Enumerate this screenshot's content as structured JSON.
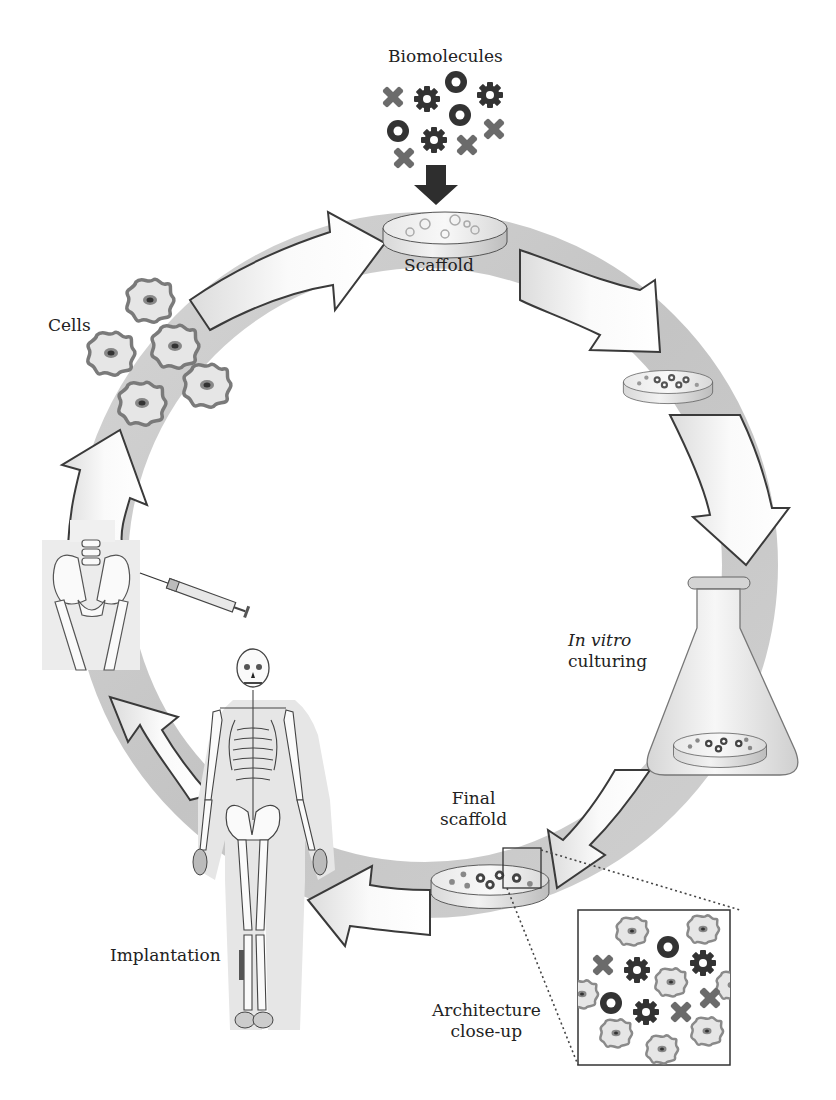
{
  "diagram": {
    "type": "cycle",
    "colors": {
      "ring": "#c8c8c8",
      "arrow_fill": "#f4f4f4",
      "arrow_stroke": "#3a3a3a",
      "gear": "#333333",
      "ring_molecule": "#333333",
      "x_molecule": "#6b6b6b",
      "cell_outline": "#777777",
      "cell_fill": "#e4e4e4",
      "nucleus": "#444444",
      "background": "#ffffff"
    },
    "labels": {
      "biomolecules": "Biomolecules",
      "scaffold": "Scaffold",
      "cells": "Cells",
      "in_vitro_italic": "In vitro",
      "culturing": "culturing",
      "final_line1": "Final",
      "final_line2": "scaffold",
      "implantation": "Implantation",
      "architecture_line1": "Architecture",
      "architecture_line2": "close-up"
    },
    "stages": [
      {
        "id": "biomolecules",
        "label": "Biomolecules",
        "icon": "biomolecule-cluster-icon"
      },
      {
        "id": "scaffold",
        "label": "Scaffold",
        "icon": "scaffold-disc-icon"
      },
      {
        "id": "seeded-scaffold",
        "label": "",
        "icon": "seeded-scaffold-disc-icon"
      },
      {
        "id": "in-vitro-culturing",
        "label": "In vitro culturing",
        "icon": "erlenmeyer-flask-icon"
      },
      {
        "id": "final-scaffold",
        "label": "Final scaffold",
        "icon": "final-scaffold-disc-icon"
      },
      {
        "id": "architecture-close-up",
        "label": "Architecture close-up",
        "icon": "magnified-inset-icon"
      },
      {
        "id": "implantation",
        "label": "Implantation",
        "icon": "human-skeleton-icon"
      },
      {
        "id": "cell-harvest",
        "label": "",
        "icon": "pelvis-syringe-icon"
      },
      {
        "id": "cells",
        "label": "Cells",
        "icon": "cell-cluster-icon"
      }
    ],
    "flow": [
      "cells -> scaffold",
      "scaffold -> seeded-scaffold",
      "seeded-scaffold -> in-vitro-culturing",
      "in-vitro-culturing -> final-scaffold",
      "final-scaffold -> implantation",
      "implantation -> cell-harvest",
      "cell-harvest -> cells",
      "biomolecules -> scaffold"
    ],
    "legend_molecule_kinds": [
      "gear",
      "ring",
      "cross"
    ]
  }
}
